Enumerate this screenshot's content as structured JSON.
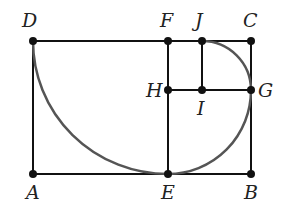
{
  "diagram": {
    "colors": {
      "line": "#111111",
      "arc": "#555555",
      "point": "#111111"
    },
    "points": [
      {
        "label": "D",
        "x": 33,
        "y": 41,
        "lx": 22,
        "ly": 27
      },
      {
        "label": "F",
        "x": 168,
        "y": 41,
        "lx": 160,
        "ly": 27
      },
      {
        "label": "J",
        "x": 202,
        "y": 41,
        "lx": 195,
        "ly": 27
      },
      {
        "label": "C",
        "x": 251,
        "y": 41,
        "lx": 243,
        "ly": 27
      },
      {
        "label": "H",
        "x": 168,
        "y": 90,
        "lx": 146,
        "ly": 97
      },
      {
        "label": "I",
        "x": 202,
        "y": 90,
        "lx": 197,
        "ly": 115
      },
      {
        "label": "G",
        "x": 251,
        "y": 90,
        "lx": 258,
        "ly": 97
      },
      {
        "label": "A",
        "x": 33,
        "y": 174,
        "lx": 26,
        "ly": 199
      },
      {
        "label": "E",
        "x": 168,
        "y": 174,
        "lx": 161,
        "ly": 199
      },
      {
        "label": "B",
        "x": 251,
        "y": 174,
        "lx": 244,
        "ly": 199
      }
    ]
  }
}
